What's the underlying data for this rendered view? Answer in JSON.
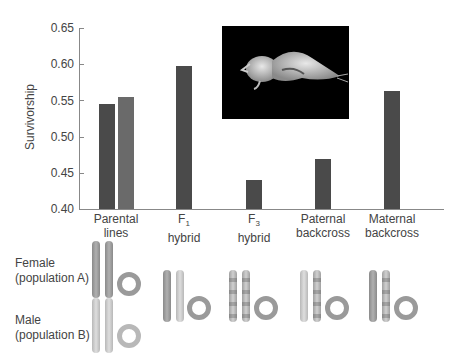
{
  "chart_data": {
    "type": "bar",
    "title": "",
    "xlabel": "",
    "ylabel": "Survivorship",
    "ylim": [
      0.4,
      0.65
    ],
    "yticks": [
      "0.65",
      "0.60",
      "0.55",
      "0.50",
      "0.45",
      "0.40"
    ],
    "grid": false,
    "categories": [
      "Parental lines",
      "F1 hybrid",
      "F3 hybrid",
      "Paternal backcross",
      "Maternal backcross"
    ],
    "bars": [
      {
        "category": "Parental lines",
        "label": "Parental line A",
        "value": 0.545,
        "color": "#4a4a4a"
      },
      {
        "category": "Parental lines",
        "label": "Parental line B",
        "value": 0.555,
        "color": "#6a6a6a"
      },
      {
        "category": "F1 hybrid",
        "value": 0.597,
        "color": "#4a4a4a"
      },
      {
        "category": "F3 hybrid",
        "value": 0.44,
        "color": "#4a4a4a"
      },
      {
        "category": "Paternal backcross",
        "value": 0.469,
        "color": "#4a4a4a"
      },
      {
        "category": "Maternal backcross",
        "value": 0.563,
        "color": "#4a4a4a"
      }
    ]
  },
  "axis": {
    "ylabel": "Survivorship",
    "ticks": [
      "0.65",
      "0.60",
      "0.55",
      "0.50",
      "0.45",
      "0.40"
    ]
  },
  "categories": [
    {
      "line1": "Parental",
      "line2": "lines"
    },
    {
      "line1": "F",
      "sub": "1",
      "line2": "hybrid"
    },
    {
      "line1": "F",
      "sub": "3",
      "line2": "hybrid"
    },
    {
      "line1": "Paternal",
      "line2": "backcross"
    },
    {
      "line1": "Maternal",
      "line2": "backcross"
    }
  ],
  "photo": {
    "description": "copepod specimen on black background"
  },
  "diagram": {
    "female_label_1": "Female",
    "female_label_2": "(population A)",
    "male_label_1": "Male",
    "male_label_2": "(population B)"
  }
}
